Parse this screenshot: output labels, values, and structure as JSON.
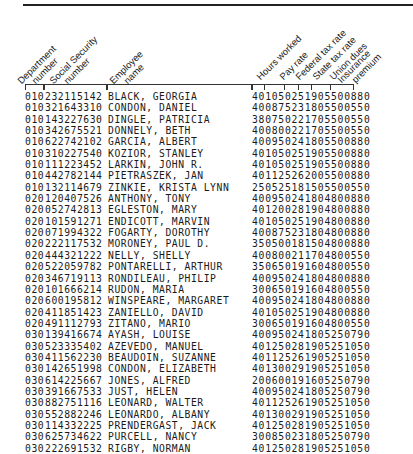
{
  "headers": {
    "department": "Department\nnumber",
    "department_l1": "Department",
    "department_l2": "number",
    "ssn_l1": "Social Security",
    "ssn_l2": "number",
    "name_l1": "Employee",
    "name_l2": "name",
    "hours": "Hours worked",
    "pay": "Pay rate",
    "federal": "Federal tax rate",
    "state": "State tax rate",
    "union": "Union dues",
    "insurance_l1": "Insurance",
    "insurance_l2": "premium"
  },
  "records": [
    {
      "dept": "010",
      "ssn": "232115142",
      "name": "BLACK, GEORGIA",
      "nums": "401050251905500880"
    },
    {
      "dept": "010",
      "ssn": "321643310",
      "name": "CONDON, DANIEL",
      "nums": "400875231805500550"
    },
    {
      "dept": "010",
      "ssn": "143227630",
      "name": "DINGLE, PATRICIA",
      "nums": "380750221705500550"
    },
    {
      "dept": "010",
      "ssn": "342675521",
      "name": "DONNELY, BETH",
      "nums": "400800221705500550"
    },
    {
      "dept": "010",
      "ssn": "622742102",
      "name": "GARCIA, ALBERT",
      "nums": "400950241805500880"
    },
    {
      "dept": "010",
      "ssn": "310227540",
      "name": "KOZIOR, STANLEY",
      "nums": "401050251905500880"
    },
    {
      "dept": "010",
      "ssn": "111223452",
      "name": "LARKIN, JOHN R.",
      "nums": "401050251905500880"
    },
    {
      "dept": "010",
      "ssn": "442782144",
      "name": "PIETRASZEK, JAN",
      "nums": "401125262005500880"
    },
    {
      "dept": "010",
      "ssn": "132114679",
      "name": "ZINKIE, KRISTA LYNN",
      "nums": "250525181505500550"
    },
    {
      "dept": "020",
      "ssn": "120407526",
      "name": "ANTHONY, TONY",
      "nums": "400950241804800880"
    },
    {
      "dept": "020",
      "ssn": "052742813",
      "name": "EGLESTON, MARY",
      "nums": "401200281904800880"
    },
    {
      "dept": "020",
      "ssn": "101591271",
      "name": "ENDICOTT, MARVIN",
      "nums": "401050251904800880"
    },
    {
      "dept": "020",
      "ssn": "071994322",
      "name": "FOGARTY, DOROTHY",
      "nums": "400875231804800880"
    },
    {
      "dept": "020",
      "ssn": "222117532",
      "name": "MORONEY, PAUL D.",
      "nums": "350500181504800880"
    },
    {
      "dept": "020",
      "ssn": "444321222",
      "name": "NELLY, SHELLY",
      "nums": "400800211704800550"
    },
    {
      "dept": "020",
      "ssn": "522059782",
      "name": "PONTARELLI, ARTHUR",
      "nums": "350650191604800550"
    },
    {
      "dept": "020",
      "ssn": "346719113",
      "name": "RONDILEAU, PHILIP",
      "nums": "400950241804800880"
    },
    {
      "dept": "020",
      "ssn": "101666214",
      "name": "RUDON, MARIA",
      "nums": "300650191604800550"
    },
    {
      "dept": "020",
      "ssn": "600195812",
      "name": "WINSPEARE, MARGARET",
      "nums": "400950241804800880"
    },
    {
      "dept": "020",
      "ssn": "411851423",
      "name": "ZANIELLO, DAVID",
      "nums": "401050251904800880"
    },
    {
      "dept": "020",
      "ssn": "491112793",
      "name": "ZITANO, MARIO",
      "nums": "300650191604800550"
    },
    {
      "dept": "030",
      "ssn": "139416674",
      "name": "AYASH, LOUISE",
      "nums": "400950241805250790"
    },
    {
      "dept": "030",
      "ssn": "523335402",
      "name": "AZEVEDO, MANUEL",
      "nums": "401250281905251050"
    },
    {
      "dept": "030",
      "ssn": "411562230",
      "name": "BEAUDOIN, SUZANNE",
      "nums": "401125261905251050"
    },
    {
      "dept": "030",
      "ssn": "142651998",
      "name": "CONDON, ELIZABETH",
      "nums": "401300291905251050"
    },
    {
      "dept": "030",
      "ssn": "614225667",
      "name": "JONES, ALFRED",
      "nums": "200600191605250790"
    },
    {
      "dept": "030",
      "ssn": "391667533",
      "name": "JUST, HELEN",
      "nums": "400950241805250790"
    },
    {
      "dept": "030",
      "ssn": "882751116",
      "name": "LEONARD, WALTER",
      "nums": "401125261905251050"
    },
    {
      "dept": "030",
      "ssn": "552882246",
      "name": "LEONARDO, ALBANY",
      "nums": "401300291905251050"
    },
    {
      "dept": "030",
      "ssn": "114332225",
      "name": "PRENDERGAST, JACK",
      "nums": "401250281905251050"
    },
    {
      "dept": "030",
      "ssn": "625734622",
      "name": "PURCELL, NANCY",
      "nums": "300850231805250790"
    },
    {
      "dept": "030",
      "ssn": "222691532",
      "name": "RIGBY, NORMAN",
      "nums": "401250281905251050"
    },
    {
      "dept": "030",
      "ssn": "615766791",
      "name": "TANGUAY, ROSEMARY",
      "nums": "300850231805250790"
    }
  ]
}
